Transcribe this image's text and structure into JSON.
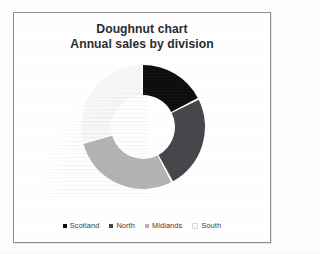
{
  "chart_data": {
    "type": "pie",
    "variant": "doughnut",
    "title": "Doughnut chart",
    "subtitle": "Annual sales by division",
    "xlabel": "",
    "ylabel": "",
    "legend_position": "bottom",
    "grid": false,
    "start_angle_deg": 0,
    "direction": "clockwise",
    "inner_radius_ratio": 0.52,
    "categories": [
      "Scotland",
      "North",
      "Midlands",
      "South"
    ],
    "values": [
      17,
      24,
      28,
      28
    ],
    "units": "percent",
    "colors": [
      "#0d0d0d",
      "#45454a",
      "#b3b3b3",
      "#f7f7f7"
    ],
    "slices": [
      {
        "label": "Scotland",
        "value": 17,
        "color": "#0d0d0d",
        "start_deg": 0,
        "end_deg": 62
      },
      {
        "label": "North",
        "value": 24,
        "color": "#45454a",
        "start_deg": 64,
        "end_deg": 151
      },
      {
        "label": "Midlands",
        "value": 28,
        "color": "#b3b3b3",
        "start_deg": 153,
        "end_deg": 254
      },
      {
        "label": "South",
        "value": 28,
        "color": "#f7f7f7",
        "start_deg": 256,
        "end_deg": 358
      }
    ]
  },
  "chart": {
    "title_line1": "Doughnut chart",
    "title_line2": "Annual sales by division"
  },
  "legend": {
    "items": [
      {
        "label": "Scotland",
        "color": "#0d0d0d"
      },
      {
        "label": "North",
        "color": "#45454a"
      },
      {
        "label": "Midlands",
        "color": "#b3b3b3"
      },
      {
        "label": "South",
        "color": "#fbfbfb"
      }
    ]
  },
  "frame": {
    "border_color": "#8d8d92",
    "background": "#ffffff"
  }
}
